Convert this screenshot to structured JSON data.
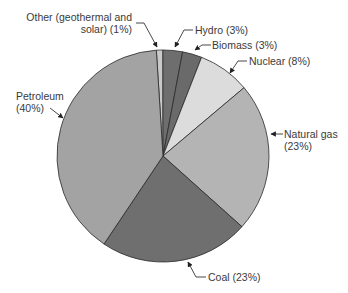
{
  "chart_data": {
    "type": "pie",
    "title": "",
    "start_angle_deg": -3.6,
    "direction": "clockwise",
    "slices": [
      {
        "name": "Other (geothermal and solar)",
        "value": 1,
        "color": "#c9c9c9"
      },
      {
        "name": "Hydro",
        "value": 3,
        "color": "#6e6e6e"
      },
      {
        "name": "Biomass",
        "value": 3,
        "color": "#6a6a6a"
      },
      {
        "name": "Nuclear",
        "value": 8,
        "color": "#dcdcdc"
      },
      {
        "name": "Natural gas",
        "value": 23,
        "color": "#b4b4b4"
      },
      {
        "name": "Coal",
        "value": 23,
        "color": "#6f6f6f"
      },
      {
        "name": "Petroleum",
        "value": 40,
        "color": "#a3a3a3"
      }
    ],
    "labels": {
      "other_line1": "Other (geothermal and",
      "other_line2": "solar) (1%)",
      "hydro": "Hydro (3%)",
      "biomass": "Biomass (3%)",
      "nuclear": "Nuclear (8%)",
      "natgas_line1": "Natural gas",
      "natgas_line2": "(23%)",
      "coal": "Coal (23%)",
      "petroleum_line1": "Petroleum",
      "petroleum_line2": "(40%)"
    },
    "legend": "none (callout labels)"
  }
}
